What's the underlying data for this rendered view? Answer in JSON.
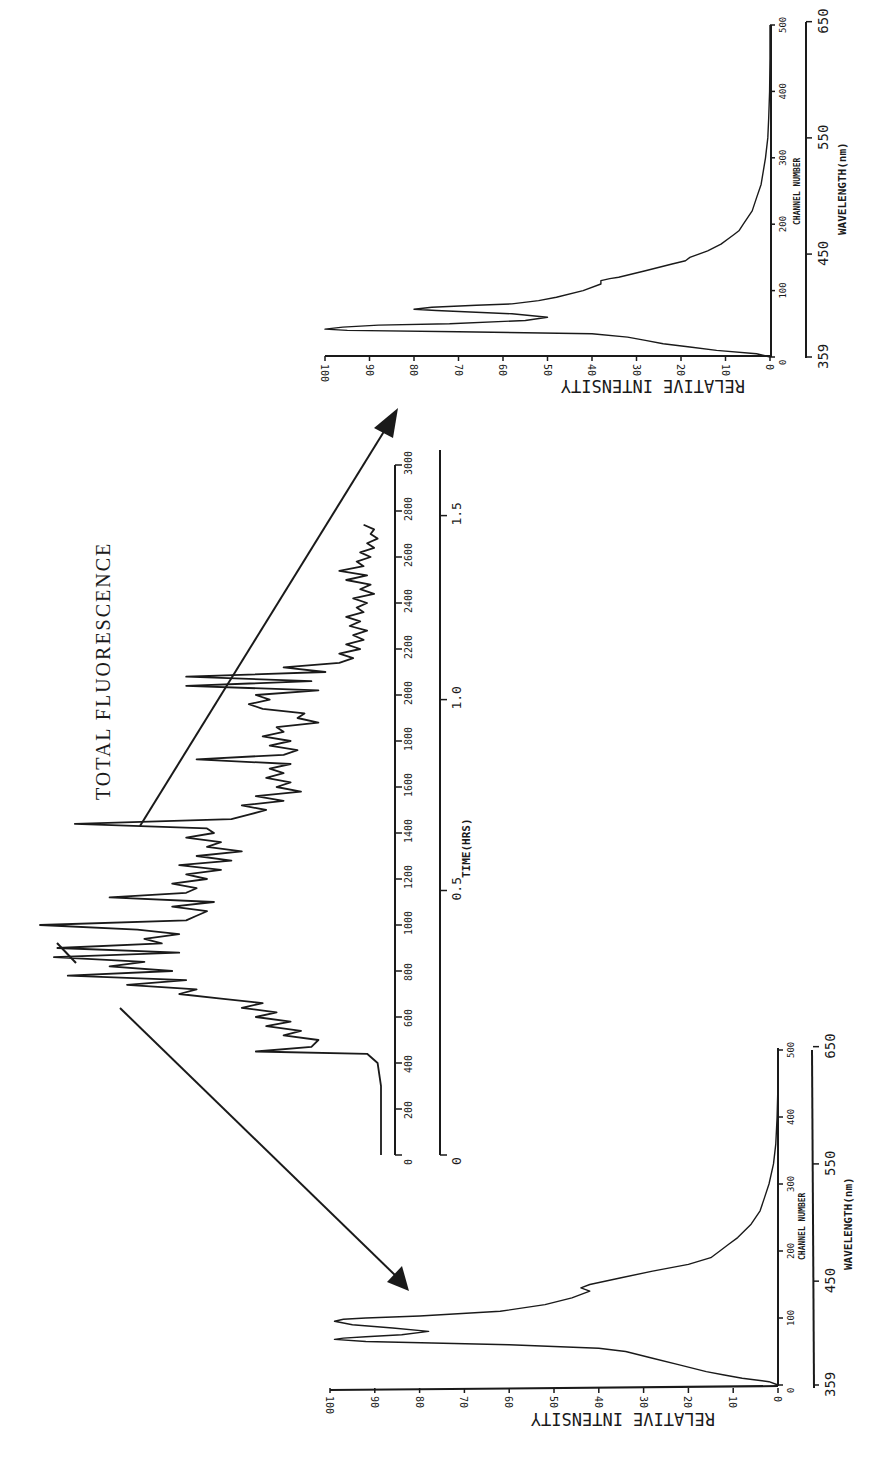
{
  "title": "TOTAL FLUORESCENCE",
  "chart_data": [
    {
      "id": "chromatogram",
      "type": "line",
      "title": "TOTAL FLUORESCENCE",
      "xlabel": "TIME(HRS)",
      "x_secondary_label": "scan number",
      "ylabel": "",
      "x_ticks": [
        0,
        200,
        400,
        600,
        800,
        1000,
        1200,
        1400,
        1600,
        1800,
        2000,
        2200,
        2400,
        2600,
        2800,
        3000
      ],
      "time_ticks": [
        "0",
        "0.5",
        "1.0",
        "1.5"
      ],
      "time_tick_positions": [
        0,
        1150,
        1980,
        2780
      ],
      "xlim": [
        0,
        3000
      ],
      "orientation": "rotated-90",
      "x": [
        0,
        100,
        200,
        300,
        400,
        440,
        450,
        470,
        500,
        520,
        540,
        560,
        580,
        600,
        620,
        640,
        660,
        680,
        700,
        720,
        740,
        760,
        780,
        800,
        820,
        840,
        860,
        880,
        900,
        920,
        940,
        960,
        980,
        1000,
        1020,
        1040,
        1060,
        1080,
        1100,
        1120,
        1140,
        1160,
        1180,
        1200,
        1220,
        1240,
        1260,
        1280,
        1300,
        1320,
        1340,
        1360,
        1380,
        1400,
        1420,
        1440,
        1460,
        1480,
        1500,
        1520,
        1540,
        1560,
        1580,
        1600,
        1620,
        1640,
        1660,
        1680,
        1700,
        1720,
        1740,
        1760,
        1780,
        1800,
        1820,
        1840,
        1860,
        1880,
        1900,
        1920,
        1940,
        1960,
        1980,
        2000,
        2020,
        2040,
        2060,
        2080,
        2100,
        2120,
        2140,
        2160,
        2180,
        2200,
        2220,
        2240,
        2260,
        2280,
        2300,
        2320,
        2340,
        2360,
        2380,
        2400,
        2420,
        2440,
        2460,
        2480,
        2500,
        2520,
        2540,
        2560,
        2580,
        2600,
        2620,
        2640,
        2660,
        2680,
        2700,
        2720,
        2740,
        2760,
        2780,
        2800,
        2820
      ],
      "y": [
        2,
        2,
        2,
        2,
        3,
        6,
        38,
        22,
        20,
        30,
        25,
        35,
        28,
        38,
        32,
        42,
        36,
        48,
        60,
        55,
        75,
        58,
        92,
        62,
        80,
        70,
        96,
        60,
        95,
        65,
        70,
        60,
        72,
        100,
        58,
        55,
        52,
        62,
        50,
        80,
        58,
        55,
        62,
        52,
        58,
        48,
        60,
        45,
        55,
        42,
        52,
        48,
        58,
        50,
        52,
        90,
        45,
        40,
        35,
        42,
        30,
        38,
        25,
        32,
        28,
        35,
        30,
        34,
        28,
        55,
        30,
        26,
        34,
        28,
        36,
        30,
        32,
        20,
        26,
        24,
        36,
        40,
        34,
        38,
        20,
        58,
        22,
        58,
        18,
        30,
        14,
        10,
        14,
        8,
        12,
        7,
        10,
        6,
        11,
        8,
        12,
        7,
        9,
        6,
        10,
        4,
        8,
        5,
        12,
        6,
        14,
        7,
        9,
        5,
        8,
        4,
        6,
        3,
        5,
        4,
        7
      ],
      "ylim": [
        0,
        100
      ]
    },
    {
      "id": "spectrum-early",
      "type": "line",
      "title": "",
      "xlabel": "CHANNEL NUMBER",
      "x2label": "WAVELENGTH(nm)",
      "ylabel": "RELATIVE INTENSITY",
      "x_ticks": [
        0,
        100,
        200,
        300,
        400,
        500
      ],
      "wavelength_ticks": [
        "359",
        "450",
        "550",
        "650"
      ],
      "wavelength_tick_channels": [
        0,
        155,
        330,
        505
      ],
      "y_ticks": [
        0,
        10,
        20,
        30,
        40,
        50,
        60,
        70,
        80,
        90,
        100
      ],
      "xlim": [
        0,
        500
      ],
      "ylim": [
        0,
        100
      ],
      "x": [
        0,
        5,
        10,
        15,
        20,
        30,
        40,
        50,
        55,
        60,
        65,
        68,
        70,
        72,
        75,
        80,
        85,
        90,
        95,
        98,
        100,
        103,
        110,
        120,
        130,
        140,
        145,
        150,
        160,
        170,
        180,
        190,
        200,
        210,
        220,
        240,
        260,
        280,
        300,
        330,
        360,
        400,
        450,
        500
      ],
      "y": [
        0,
        2,
        8,
        12,
        16,
        22,
        28,
        34,
        40,
        60,
        92,
        99,
        97,
        92,
        84,
        78,
        86,
        95,
        99,
        97,
        92,
        80,
        62,
        52,
        46,
        42,
        44,
        42,
        35,
        28,
        20,
        15,
        13,
        11,
        9,
        6,
        4,
        3,
        2,
        1,
        0.5,
        0.2,
        0,
        0
      ]
    },
    {
      "id": "spectrum-late",
      "type": "line",
      "title": "",
      "xlabel": "CHANNEL NUMBER",
      "x2label": "WAVELENGTH(nm)",
      "ylabel": "RELATIVE INTENSITY",
      "x_ticks": [
        0,
        100,
        200,
        300,
        400,
        500
      ],
      "wavelength_ticks": [
        "359",
        "450",
        "550",
        "650"
      ],
      "wavelength_tick_channels": [
        0,
        155,
        330,
        505
      ],
      "y_ticks": [
        0,
        10,
        20,
        30,
        40,
        50,
        60,
        70,
        80,
        90,
        100
      ],
      "xlim": [
        0,
        500
      ],
      "ylim": [
        0,
        100
      ],
      "x": [
        0,
        5,
        10,
        15,
        20,
        25,
        30,
        35,
        38,
        40,
        42,
        45,
        48,
        50,
        55,
        60,
        65,
        70,
        72,
        75,
        78,
        80,
        85,
        90,
        100,
        110,
        115,
        118,
        120,
        130,
        140,
        145,
        150,
        160,
        170,
        180,
        185,
        190,
        200,
        220,
        240,
        260,
        280,
        300,
        330,
        360,
        400,
        450,
        500
      ],
      "y": [
        0,
        3,
        12,
        18,
        24,
        28,
        32,
        40,
        70,
        95,
        100,
        96,
        88,
        72,
        55,
        50,
        58,
        75,
        80,
        76,
        66,
        58,
        52,
        48,
        42,
        38,
        38,
        36,
        34,
        28,
        22,
        19,
        18,
        14,
        11,
        9,
        8,
        7,
        6,
        4,
        3,
        2,
        1.5,
        1,
        0.5,
        0.3,
        0.1,
        0,
        0
      ]
    }
  ],
  "chromatogram": {
    "title": "TOTAL FLUORESCENCE",
    "scan_ticks": [
      "0",
      "200",
      "400",
      "600",
      "800",
      "1000",
      "1200",
      "1400",
      "1600",
      "1800",
      "2000",
      "2200",
      "2400",
      "2600",
      "2800",
      "3000"
    ],
    "time_label": "TIME(HRS)",
    "time_ticks": [
      "0",
      "0.5",
      "1.0",
      "1.5"
    ]
  },
  "spectrum_top": {
    "ylabel": "RELATIVE INTENSITY",
    "y_ticks": [
      "100",
      "90",
      "80",
      "70",
      "60",
      "50",
      "40",
      "30",
      "20",
      "10",
      "0"
    ],
    "channel_ticks": [
      "0",
      "100",
      "200",
      "300",
      "400",
      "500"
    ],
    "channel_label": "CHANNEL NUMBER",
    "wavelength_ticks": [
      "359",
      "450",
      "550",
      "650"
    ],
    "wavelength_label": "WAVELENGTH(nm)"
  },
  "spectrum_bottom": {
    "ylabel": "RELATIVE INTENSITY",
    "y_ticks": [
      "100",
      "90",
      "80",
      "70",
      "60",
      "50",
      "40",
      "30",
      "20",
      "10",
      "0"
    ],
    "channel_ticks": [
      "0",
      "100",
      "200",
      "300",
      "400",
      "500"
    ],
    "channel_label": "CHANNEL NUMBER",
    "wavelength_ticks": [
      "359",
      "450",
      "550",
      "650"
    ],
    "wavelength_label": "WAVELENGTH(nm)"
  },
  "colors": {
    "ink": "#1a1a1a",
    "paper": "#ffffff"
  }
}
